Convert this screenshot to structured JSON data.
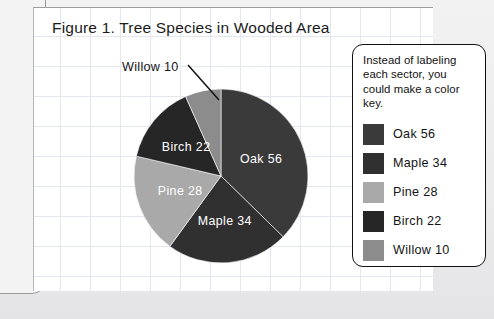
{
  "figure": {
    "title": "Figure 1. Tree Species in Wooded Area"
  },
  "callout": {
    "note": "Instead of labeling each sector, you could make a color key."
  },
  "annotation": {
    "willow_label": "Willow 10"
  },
  "chart_data": {
    "type": "pie",
    "title": "Figure 1. Tree Species in Wooded Area",
    "xlabel": "",
    "ylabel": "",
    "total": 150,
    "start_angle_deg": 0,
    "direction": "clockwise",
    "categories": [
      "Oak",
      "Maple",
      "Pine",
      "Birch",
      "Willow"
    ],
    "values": [
      56,
      34,
      28,
      22,
      10
    ],
    "slice_labels": [
      "Oak 56",
      "Maple 34",
      "Pine 28",
      "Birch 22",
      "Willow 10"
    ],
    "colors": [
      "#3a3a3a",
      "#303030",
      "#a9a9a9",
      "#262626",
      "#8c8c8c"
    ],
    "legend_position": "right",
    "legend_entries": [
      {
        "label": "Oak 56",
        "color": "#3a3a3a"
      },
      {
        "label": "Maple 34",
        "color": "#303030"
      },
      {
        "label": "Pine 28",
        "color": "#a9a9a9"
      },
      {
        "label": "Birch 22",
        "color": "#262626"
      },
      {
        "label": "Willow 10",
        "color": "#8c8c8c"
      }
    ],
    "grid": true,
    "annotations": [
      {
        "text": "Willow 10",
        "points_to": "Willow",
        "style": "leader-line"
      }
    ]
  }
}
